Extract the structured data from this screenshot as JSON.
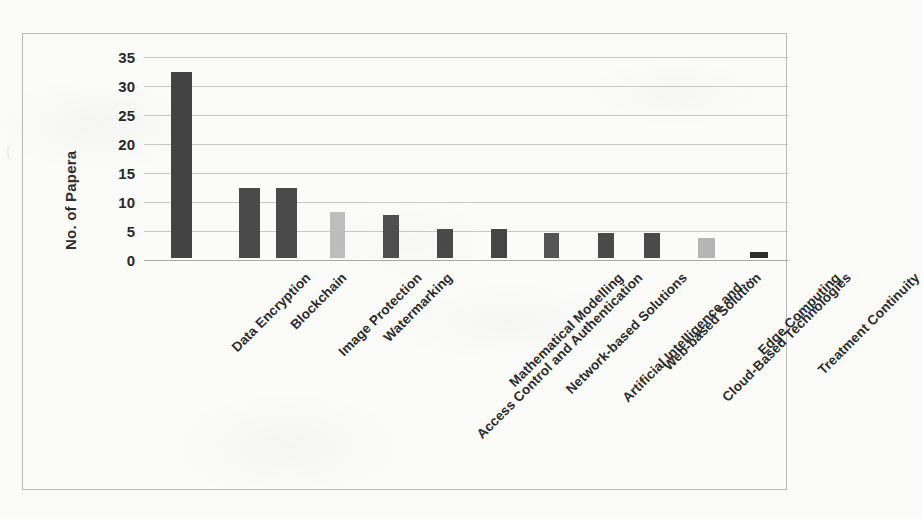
{
  "chart_data": {
    "type": "bar",
    "title": "",
    "subtitle": "",
    "xlabel": "",
    "ylabel": "No. of Papera",
    "ylim": [
      0,
      35
    ],
    "ytick_interval": 5,
    "yticks": [
      "35",
      "30",
      "25",
      "20",
      "15",
      "10",
      "5",
      "0"
    ],
    "grid": true,
    "legend": "none",
    "orientation": "vertical",
    "xtick_rotation": -45,
    "categories": [
      "Data Encryption",
      "Blockchain",
      "Image Protection",
      "Watermarking",
      "Access Control and Authentication",
      "Mathematical Modelling",
      "Network-based Solutions",
      "Artificial Intelligence and…",
      "Web-based Solution",
      "Cloud-Based Technologies",
      "Edge Computing",
      "Treatment Continuity"
    ],
    "values": [
      32,
      12,
      12,
      8,
      7.5,
      5,
      5,
      4.3,
      4.3,
      4.3,
      3.5,
      1
    ],
    "bar_colors": [
      "#434343",
      "#4a4a4a",
      "#4a4a4a",
      "#bdbdbd",
      "#4f4f4f",
      "#4a4a4a",
      "#454545",
      "#555555",
      "#4a4a4a",
      "#4a4a4a",
      "#b5b5b5",
      "#2e2e2e"
    ]
  },
  "colors": {
    "bar_dark": "#434343",
    "bar_light": "#bdbdbd",
    "gridline": "#c2c2c2",
    "frame_border": "#b9b9b9",
    "background": "#fbfbfa",
    "text": "#2a2a2a"
  },
  "bleed_text": {
    "left_mark": "(",
    "mid_mark": "."
  }
}
